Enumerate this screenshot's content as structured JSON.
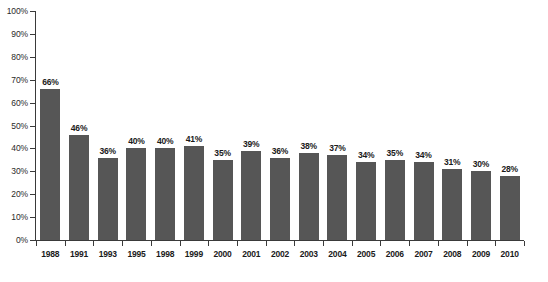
{
  "chart_data": {
    "type": "bar",
    "title": "",
    "subtitle": "",
    "xlabel": "",
    "ylabel": "",
    "ylim": [
      0,
      100
    ],
    "y_tick_labels": [
      "0%",
      "10%",
      "20%",
      "30%",
      "40%",
      "50%",
      "60%",
      "70%",
      "80%",
      "90%",
      "100%"
    ],
    "y_tick_values": [
      0,
      10,
      20,
      30,
      40,
      50,
      60,
      70,
      80,
      90,
      100
    ],
    "grid": false,
    "legend": false,
    "legend_position": "none",
    "value_label_suffix": "%",
    "bar_color": "#565656",
    "axis_color": "#3a3a3a",
    "background_color": "#ffffff",
    "categories": [
      "1988",
      "1991",
      "1993",
      "1995",
      "1998",
      "1999",
      "2000",
      "2001",
      "2002",
      "2003",
      "2004",
      "2005",
      "2006",
      "2007",
      "2008",
      "2009",
      "2010"
    ],
    "values": [
      66,
      46,
      36,
      40,
      40,
      41,
      35,
      39,
      36,
      38,
      37,
      34,
      35,
      34,
      31,
      30,
      28
    ],
    "data_labels": [
      "66%",
      "46%",
      "36%",
      "40%",
      "40%",
      "41%",
      "35%",
      "39%",
      "36%",
      "38%",
      "37%",
      "34%",
      "35%",
      "34%",
      "31%",
      "30%",
      "28%"
    ],
    "points": [
      {
        "category": "1988",
        "value": 66,
        "label": "66%"
      },
      {
        "category": "1991",
        "value": 46,
        "label": "46%"
      },
      {
        "category": "1993",
        "value": 36,
        "label": "36%"
      },
      {
        "category": "1995",
        "value": 40,
        "label": "40%"
      },
      {
        "category": "1998",
        "value": 40,
        "label": "40%"
      },
      {
        "category": "1999",
        "value": 41,
        "label": "41%"
      },
      {
        "category": "2000",
        "value": 35,
        "label": "35%"
      },
      {
        "category": "2001",
        "value": 39,
        "label": "39%"
      },
      {
        "category": "2002",
        "value": 36,
        "label": "36%"
      },
      {
        "category": "2003",
        "value": 38,
        "label": "38%"
      },
      {
        "category": "2004",
        "value": 37,
        "label": "37%"
      },
      {
        "category": "2005",
        "value": 34,
        "label": "34%"
      },
      {
        "category": "2006",
        "value": 35,
        "label": "35%"
      },
      {
        "category": "2007",
        "value": 34,
        "label": "34%"
      },
      {
        "category": "2008",
        "value": 31,
        "label": "31%"
      },
      {
        "category": "2009",
        "value": 30,
        "label": "30%"
      },
      {
        "category": "2010",
        "value": 28,
        "label": "28%"
      }
    ]
  }
}
